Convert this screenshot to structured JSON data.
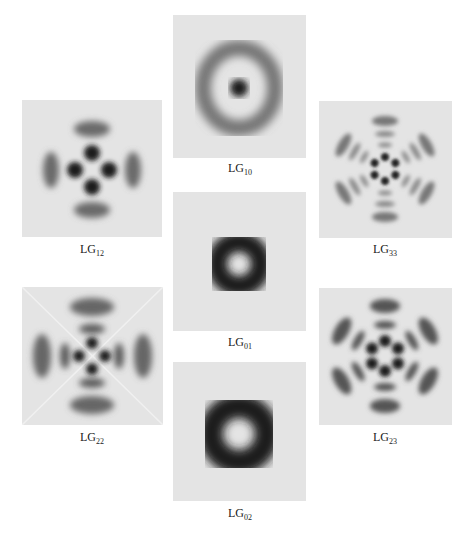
{
  "figure": {
    "panels": [
      {
        "id": "lg10",
        "base": "LG",
        "sub": "10",
        "p": 1,
        "l": 0
      },
      {
        "id": "lg12",
        "base": "LG",
        "sub": "12",
        "p": 1,
        "l": 2
      },
      {
        "id": "lg33",
        "base": "LG",
        "sub": "33",
        "p": 3,
        "l": 3
      },
      {
        "id": "lg01",
        "base": "LG",
        "sub": "01",
        "p": 0,
        "l": 1
      },
      {
        "id": "lg22",
        "base": "LG",
        "sub": "22",
        "p": 2,
        "l": 2
      },
      {
        "id": "lg23",
        "base": "LG",
        "sub": "23",
        "p": 2,
        "l": 3
      },
      {
        "id": "lg02",
        "base": "LG",
        "sub": "02",
        "p": 0,
        "l": 2
      }
    ]
  },
  "colors": {
    "panel_background": "#e4e4e4",
    "intensity_dark": "#1a1a1a"
  }
}
